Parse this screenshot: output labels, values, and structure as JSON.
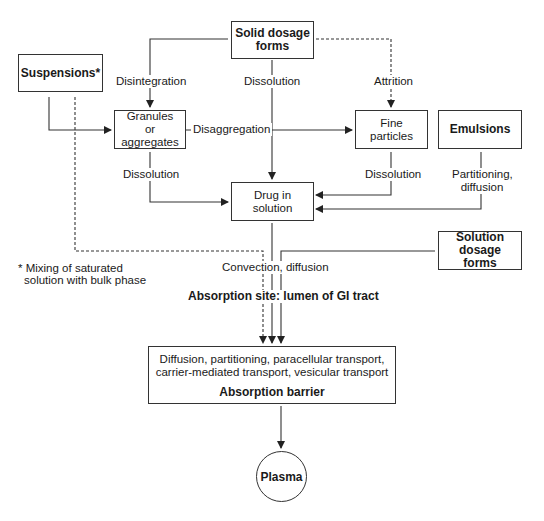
{
  "nodes": {
    "solid": "Solid dosage forms",
    "suspensions": "Suspensions*",
    "granules": "Granules or aggregates",
    "fine": "Fine particles",
    "emulsions": "Emulsions",
    "drug": "Drug in solution",
    "solution_forms": "Solution dosage forms",
    "barrier_text_1": "Diffusion, partitioning, paracellular transport,",
    "barrier_text_2": "carrier-mediated transport, vesicular transport",
    "barrier_title": "Absorption barrier",
    "plasma": "Plasma"
  },
  "edges": {
    "disintegration": "Disintegration",
    "dissolution_solid": "Dissolution",
    "attrition": "Attrition",
    "disaggregation": "Disaggregation",
    "dissolution_granules": "Dissolution",
    "dissolution_fine": "Dissolution",
    "partitioning_1": "Partitioning,",
    "partitioning_2": "diffusion",
    "convection": "Convection, diffusion"
  },
  "annotations": {
    "footnote_1": "* Mixing of saturated",
    "footnote_2": "solution with bulk phase",
    "absorption_site": "Absorption site: lumen of GI tract"
  }
}
